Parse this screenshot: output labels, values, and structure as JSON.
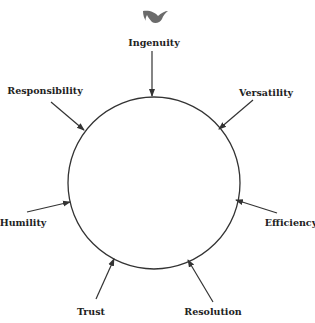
{
  "diagram": {
    "logo_icon": "swallow-bird-icon",
    "center_shape": "circle",
    "stroke_color": "#333333",
    "icon_color": "#6b6b6b",
    "labels": [
      {
        "text": "Ingenuity",
        "x": 154,
        "y": 42
      },
      {
        "text": "Versatility",
        "x": 266,
        "y": 92
      },
      {
        "text": "Efficiency",
        "x": 291,
        "y": 222
      },
      {
        "text": "Resolution",
        "x": 213,
        "y": 311
      },
      {
        "text": "Trust",
        "x": 91,
        "y": 311
      },
      {
        "text": "Humility",
        "x": 23,
        "y": 222
      },
      {
        "text": "Responsibility",
        "x": 45,
        "y": 90
      }
    ]
  }
}
